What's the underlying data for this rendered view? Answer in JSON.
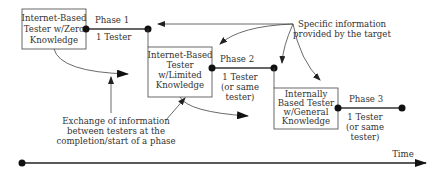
{
  "diagram": {
    "boxes": [
      {
        "id": "tester-1",
        "lines": [
          "Internet-Based",
          "Tester w/Zero",
          "Knowledge"
        ]
      },
      {
        "id": "tester-2",
        "lines": [
          "Internet-Based",
          "Tester",
          "w/Limited",
          "Knowledge"
        ]
      },
      {
        "id": "tester-3",
        "lines": [
          "Internally",
          "Based Tester",
          "w/General",
          "Knowledge"
        ]
      }
    ],
    "phases": [
      {
        "label": "Phase 1",
        "testers": [
          "1 Tester"
        ]
      },
      {
        "label": "Phase 2",
        "testers": [
          "1 Tester",
          "(or same",
          "tester)"
        ]
      },
      {
        "label": "Phase 3",
        "testers": [
          "1 Tester",
          "(or same",
          "tester)"
        ]
      }
    ],
    "annotations": {
      "target_info": [
        "Specific information",
        "provided by the target"
      ],
      "exchange": [
        "Exchange of information",
        "between testers at the",
        "completion/start of a phase"
      ]
    },
    "axis": {
      "label": "Time"
    },
    "colors": {
      "line": "#333333",
      "text": "#333333",
      "background": "#ffffff"
    }
  }
}
